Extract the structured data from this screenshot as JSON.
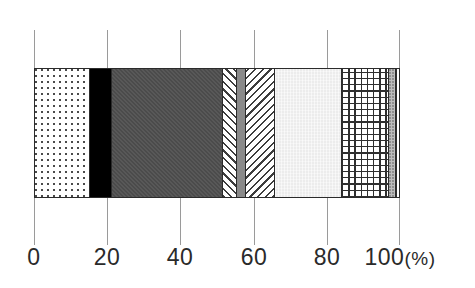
{
  "chart_data": {
    "type": "bar",
    "orientation": "horizontal",
    "stacked": true,
    "title": "",
    "subtitle": "",
    "xlabel": "",
    "ylabel": "",
    "xlim": [
      0,
      100
    ],
    "unit": "(%)",
    "grid": true,
    "legend": "none",
    "categories": [
      ""
    ],
    "tick_values": [
      0,
      20,
      40,
      60,
      80,
      100
    ],
    "tick_labels": [
      "0",
      "20",
      "40",
      "60",
      "80",
      "100"
    ],
    "axis_unit_label": "(%)",
    "cumulative_boundaries": [
      0,
      14.8,
      20.8,
      51.4,
      55.2,
      57.7,
      65.6,
      84.2,
      97.0,
      98.9,
      100.0
    ],
    "series": [
      {
        "name": "segment-1",
        "pattern": "dotted",
        "value": 14.8,
        "start": 0.0,
        "end": 14.8,
        "color": "#ffffff"
      },
      {
        "name": "segment-2",
        "pattern": "solid-black",
        "value": 6.0,
        "start": 14.8,
        "end": 20.8,
        "color": "#000000"
      },
      {
        "name": "segment-3",
        "pattern": "solid-dark-gray",
        "value": 30.6,
        "start": 20.8,
        "end": 51.4,
        "color": "#4b4b4b"
      },
      {
        "name": "segment-4",
        "pattern": "diagonal-up",
        "value": 3.8,
        "start": 51.4,
        "end": 55.2,
        "color": "#ffffff"
      },
      {
        "name": "segment-5",
        "pattern": "solid-mid-gray",
        "value": 2.5,
        "start": 55.2,
        "end": 57.7,
        "color": "#8a8a8a"
      },
      {
        "name": "segment-6",
        "pattern": "diagonal-down",
        "value": 7.9,
        "start": 57.7,
        "end": 65.6,
        "color": "#ffffff"
      },
      {
        "name": "segment-7",
        "pattern": "solid-light-gray",
        "value": 18.6,
        "start": 65.6,
        "end": 84.2,
        "color": "#ececec"
      },
      {
        "name": "segment-8",
        "pattern": "crosshatch-grid",
        "value": 12.8,
        "start": 84.2,
        "end": 97.0,
        "color": "#ffffff"
      },
      {
        "name": "segment-9",
        "pattern": "gray-stipple",
        "value": 1.9,
        "start": 97.0,
        "end": 98.9,
        "color": "#bdbdbd"
      },
      {
        "name": "segment-10",
        "pattern": "vertical-lines",
        "value": 1.1,
        "start": 98.9,
        "end": 100.0,
        "color": "#ffffff"
      }
    ]
  },
  "axis": {
    "ticks": [
      {
        "label": "0",
        "value": 0
      },
      {
        "label": "20",
        "value": 20
      },
      {
        "label": "40",
        "value": 40
      },
      {
        "label": "60",
        "value": 60
      },
      {
        "label": "80",
        "value": 80
      },
      {
        "label": "100",
        "value": 100
      }
    ],
    "unit": "(%)"
  }
}
